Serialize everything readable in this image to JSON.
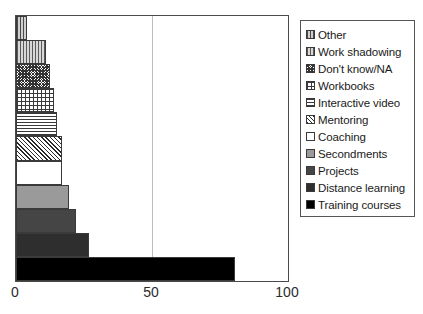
{
  "chart_data": {
    "type": "bar",
    "orientation": "horizontal",
    "title": "",
    "xlabel": "",
    "ylabel": "",
    "xlim": [
      0,
      100
    ],
    "xticks": [
      0,
      50,
      100
    ],
    "xtick_labels": [
      "0",
      "50",
      "100"
    ],
    "grid": true,
    "gridlines_at": [
      50
    ],
    "legend_position": "right",
    "categories": [
      "Other",
      "Work shadowing",
      "Don't know/NA",
      "Workbooks",
      "Interactive video",
      "Mentoring",
      "Coaching",
      "Secondments",
      "Projects",
      "Distance learning",
      "Training courses"
    ],
    "values": [
      4,
      11,
      12.5,
      14,
      15,
      17,
      17,
      19.5,
      22,
      27,
      80.5
    ],
    "bar_order_top_to_bottom": [
      "Other",
      "Work shadowing",
      "Don't know/NA",
      "Workbooks",
      "Interactive video",
      "Mentoring",
      "Coaching",
      "Secondments",
      "Projects",
      "Distance learning",
      "Training courses"
    ],
    "fills": [
      "vertical-lines-light",
      "vertical-lines",
      "dense-checker",
      "fine-grid",
      "horizontal-lines",
      "diagonal-hatch",
      "white-empty",
      "solid-light-grey",
      "solid-mid-grey",
      "solid-dark-grey",
      "solid-black"
    ],
    "colors": {
      "axis": "#4a4a4a",
      "gridline": "#bdbdbd",
      "background": "#ffffff",
      "text": "#1a1a1a",
      "solid_black": "#000000",
      "solid_dark": "#2e2e2e",
      "solid_mid": "#454545",
      "solid_light": "#9a9a9a"
    }
  },
  "legend": {
    "items": [
      {
        "label": "Other"
      },
      {
        "label": "Work shadowing"
      },
      {
        "label": "Don't know/NA"
      },
      {
        "label": "Workbooks"
      },
      {
        "label": "Interactive video"
      },
      {
        "label": "Mentoring"
      },
      {
        "label": "Coaching"
      },
      {
        "label": "Secondments"
      },
      {
        "label": "Projects"
      },
      {
        "label": "Distance learning"
      },
      {
        "label": "Training courses"
      }
    ]
  },
  "axis": {
    "ticks": [
      {
        "label": "0",
        "value": 0
      },
      {
        "label": "50",
        "value": 50
      },
      {
        "label": "100",
        "value": 100
      }
    ]
  }
}
